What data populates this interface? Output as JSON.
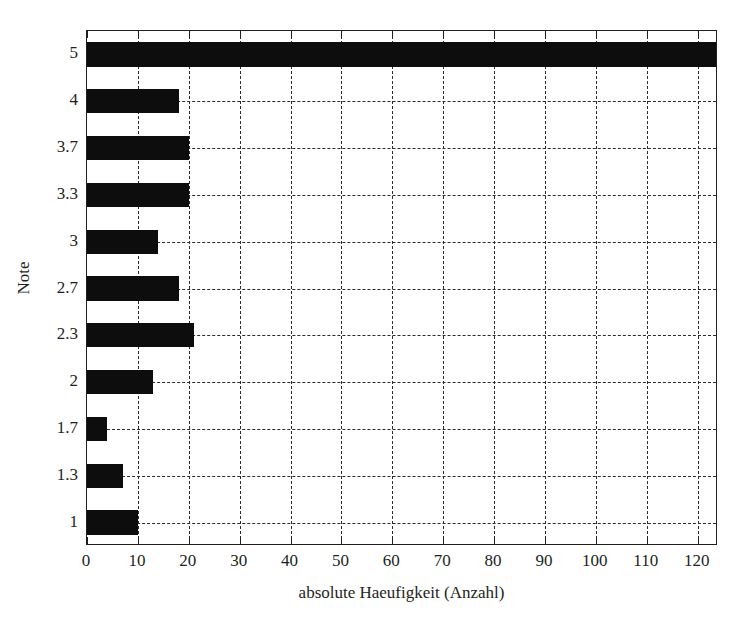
{
  "chart_data": {
    "type": "bar",
    "orientation": "horizontal",
    "title": "",
    "xlabel": "absolute Haeufigkeit (Anzahl)",
    "ylabel": "Note",
    "categories": [
      "5",
      "4",
      "3.7",
      "3.3",
      "3",
      "2.7",
      "2.3",
      "2",
      "1.7",
      "1.3",
      "1"
    ],
    "values": [
      124,
      18,
      20,
      20,
      14,
      18,
      21,
      13,
      4,
      7,
      10
    ],
    "xlim": [
      0,
      124
    ],
    "ylim_note": "categorical, 11 categories top-to-bottom",
    "xticks": [
      0,
      10,
      20,
      30,
      40,
      50,
      60,
      70,
      80,
      90,
      100,
      110,
      120
    ],
    "xticklabels": [
      "0",
      "10",
      "20",
      "30",
      "40",
      "50",
      "60",
      "70",
      "80",
      "90",
      "100",
      "110",
      "120"
    ],
    "yticklabels": [
      "5",
      "4",
      "3.7",
      "3.3",
      "3",
      "2.7",
      "2.3",
      "2",
      "1.7",
      "1.3",
      "1"
    ],
    "grid": true,
    "grid_style": "dashed",
    "legend": "none",
    "bar_color": "#0d0d0d",
    "background_color": "#ffffff",
    "axis_color": "#231f20"
  }
}
